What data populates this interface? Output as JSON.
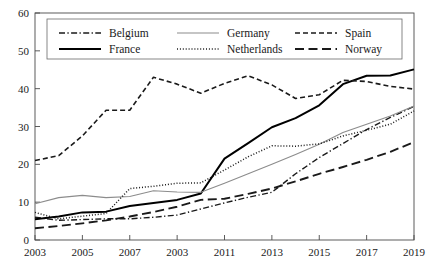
{
  "chart_data": {
    "type": "line",
    "title": "",
    "xlabel": "",
    "ylabel": "",
    "xlim": [
      2003,
      2019
    ],
    "ylim": [
      0,
      60
    ],
    "grid": false,
    "legend_position": "top-inside",
    "x": [
      2003,
      2004,
      2005,
      2006,
      2007,
      2008,
      2009,
      2010,
      2011,
      2012,
      2013,
      2014,
      2015,
      2016,
      2017,
      2018,
      2019
    ],
    "xtick_labels": [
      "2003",
      "2005",
      "2007",
      "2003",
      "2011",
      "2013",
      "2015",
      "2017",
      "2019"
    ],
    "xtick_values": [
      2003,
      2005,
      2007,
      2009,
      2011,
      2013,
      2015,
      2017,
      2019
    ],
    "ytick_labels": [
      "0",
      "10",
      "20",
      "30",
      "40",
      "50",
      "60"
    ],
    "ytick_values": [
      0,
      10,
      20,
      30,
      40,
      50,
      60
    ],
    "series": [
      {
        "name": "Belgium",
        "style": "dashdot",
        "color": "#1a1a1a",
        "values": [
          6.0,
          5.2,
          5.4,
          5.6,
          5.6,
          6.0,
          6.6,
          8.2,
          9.8,
          11.3,
          12.6,
          17.5,
          21.8,
          25.5,
          29.2,
          32.4,
          35.3
        ]
      },
      {
        "name": "France",
        "style": "solid-thick",
        "color": "#000000",
        "values": [
          5.5,
          6.2,
          7.3,
          7.5,
          9.0,
          9.8,
          10.6,
          12.3,
          21.5,
          25.6,
          29.8,
          32.2,
          35.6,
          41.2,
          43.4,
          43.5,
          45.1
        ]
      },
      {
        "name": "Germany",
        "style": "solid-thin",
        "color": "#8c8c8c",
        "values": [
          9.6,
          11.2,
          11.8,
          11.2,
          11.5,
          13.0,
          12.7,
          12.6,
          15.0,
          17.5,
          20.0,
          22.6,
          25.3,
          28.4,
          30.6,
          32.8,
          35.4
        ]
      },
      {
        "name": "Netherlands",
        "style": "dotted",
        "color": "#1a1a1a",
        "values": [
          7.3,
          5.6,
          6.3,
          7.0,
          13.6,
          14.2,
          15.0,
          15.1,
          18.5,
          22.0,
          24.9,
          24.8,
          25.4,
          27.5,
          29.0,
          30.6,
          34.1
        ]
      },
      {
        "name": "Spain",
        "style": "dashed",
        "color": "#1a1a1a",
        "values": [
          21.0,
          22.3,
          27.5,
          34.3,
          34.3,
          43.0,
          41.2,
          38.8,
          41.4,
          43.4,
          41.0,
          37.4,
          38.4,
          42.2,
          41.9,
          40.6,
          39.9
        ]
      },
      {
        "name": "Norway",
        "style": "longdash",
        "color": "#1a1a1a",
        "values": [
          3.1,
          3.7,
          4.4,
          5.2,
          6.2,
          7.4,
          8.8,
          10.6,
          10.9,
          12.2,
          13.6,
          15.5,
          17.5,
          19.3,
          21.2,
          23.3,
          25.9
        ]
      }
    ],
    "legend_entries": [
      {
        "label": "Belgium",
        "style": "dashdot",
        "color": "#1a1a1a"
      },
      {
        "label": "Germany",
        "style": "solid-thin",
        "color": "#8c8c8c"
      },
      {
        "label": "Spain",
        "style": "dashed",
        "color": "#1a1a1a"
      },
      {
        "label": "France",
        "style": "solid-thick",
        "color": "#000000"
      },
      {
        "label": "Netherlands",
        "style": "dotted",
        "color": "#1a1a1a"
      },
      {
        "label": "Norway",
        "style": "longdash",
        "color": "#1a1a1a"
      }
    ]
  }
}
